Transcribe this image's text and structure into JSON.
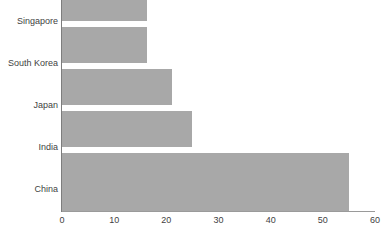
{
  "chart_data": {
    "type": "bar",
    "orientation": "horizontal",
    "title": "",
    "subtitle": "",
    "xlabel": "",
    "ylabel": "",
    "categories": [
      "Singapore",
      "South Korea",
      "Japan",
      "India",
      "China"
    ],
    "values": [
      16.3,
      16.3,
      21,
      25,
      55
    ],
    "series": [
      {
        "name": "",
        "values": [
          16.3,
          16.3,
          21,
          25,
          55
        ]
      }
    ],
    "xlim": [
      0,
      60
    ],
    "xticks": [
      0,
      10,
      20,
      30,
      40,
      50,
      60
    ],
    "xtick_labels": [
      "0",
      "10",
      "20",
      "30",
      "40",
      "50",
      "60"
    ],
    "grid": false,
    "legend": false,
    "legend_position": "none",
    "bar_color": "#a8a8a8",
    "text_color": "#3f3f3f",
    "axis_color": "#9a9a9a",
    "background_color": "#ffffff"
  },
  "axis": {
    "tick_0": "0",
    "tick_10": "10",
    "tick_20": "20",
    "tick_30": "30",
    "tick_40": "40",
    "tick_50": "50",
    "tick_60": "60"
  },
  "categories": {
    "singapore": "Singapore",
    "south_korea": "South Korea",
    "japan": "Japan",
    "india": "India",
    "china": "China"
  },
  "source": {
    "note": ""
  }
}
